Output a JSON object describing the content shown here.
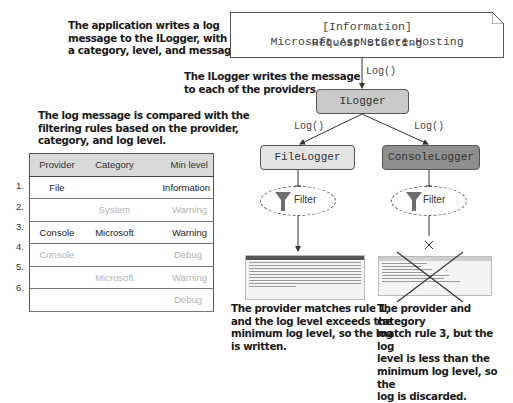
{
  "annotations": {
    "app_writes": [
      "The application writes a log",
      "message to the ILogger, with",
      "a category, level, and message."
    ],
    "ilogger_writes": [
      "The ILogger writes the message",
      "to each of the providers."
    ],
    "compared": [
      "The log message is compared with the",
      "filtering rules based on the provider,",
      "category, and log level."
    ],
    "file_result": [
      "The provider matches rule 1,",
      "and the log level exceeds the",
      "minimum log level, so the log",
      "is written."
    ],
    "console_result": [
      "The provider and category",
      "match rule 3, but the log",
      "level is less than the",
      "minimum log level, so the",
      "log is discarded."
    ]
  },
  "message": {
    "line1": "[Information] Microsoft.AspNetCore.Hosting",
    "line2": "Request Starting"
  },
  "edges": {
    "app_to_ilogger": "Log()",
    "ilogger_to_file": "Log()",
    "ilogger_to_console": "Log()"
  },
  "nodes": {
    "ilogger": "ILogger",
    "file_logger": "FileLogger",
    "console_logger": "ConsoleLogger",
    "filter_file": "Filter",
    "filter_console": "Filter"
  },
  "colors": {
    "ilogger_fill": "#c9c9c9",
    "file_logger_fill": "#e3e3e3",
    "console_logger_fill": "#8f8f8f",
    "funnel": "#6e6e6e",
    "table_header": "#d9d9d9",
    "dim_text": "#b3b3b3"
  },
  "rules_table": {
    "headers": [
      "Provider",
      "Category",
      "Min level"
    ],
    "rows": [
      {
        "index": "1.",
        "provider": "File",
        "category": "",
        "min_level": "Information",
        "matched": true
      },
      {
        "index": "2.",
        "provider": "",
        "category": "System",
        "min_level": "Warning",
        "matched": false
      },
      {
        "index": "3.",
        "provider": "Console",
        "category": "Microsoft",
        "min_level": "Warning",
        "matched": true
      },
      {
        "index": "4.",
        "provider": "Console",
        "category": "",
        "min_level": "Debug",
        "matched": false
      },
      {
        "index": "5.",
        "provider": "",
        "category": "Microsoft",
        "min_level": "Warning",
        "matched": false
      },
      {
        "index": "6.",
        "provider": "",
        "category": "",
        "min_level": "Debug",
        "matched": false
      }
    ]
  }
}
